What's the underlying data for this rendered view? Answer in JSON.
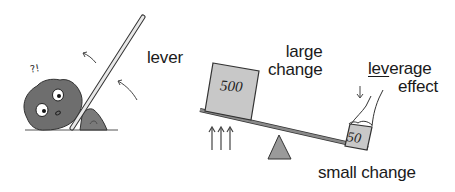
{
  "diagram": {
    "left_panel": {
      "label": "lever",
      "exclamation": "?!",
      "elements": [
        "rock-with-face",
        "lever-bar",
        "small-stone-fulcrum",
        "motion-arrows"
      ]
    },
    "right_panel": {
      "large_label_line1": "large",
      "large_label_line2": "change",
      "heavy_box_value": "500",
      "light_box_value": "50",
      "leverage_label_underlined": "lev",
      "leverage_label_rest": "erage",
      "leverage_label_line2": "effect",
      "small_label": "small change",
      "elements": [
        "seesaw-beam",
        "triangle-fulcrum",
        "up-arrows",
        "hand-pressing-down",
        "down-arrow"
      ]
    },
    "colors": {
      "rock": "#6e6e6e",
      "box_fill": "#c8c8c8",
      "fulcrum": "#9a9a9a",
      "beam": "#8a8a8a",
      "line": "#333333"
    }
  }
}
